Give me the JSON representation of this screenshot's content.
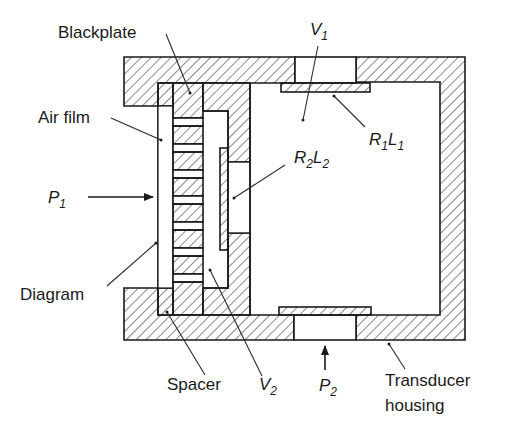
{
  "diagram": {
    "type": "cross-section",
    "labels": {
      "blackplate": "Blackplate",
      "air_film": "Air film",
      "p1": {
        "main": "P",
        "sub": "1"
      },
      "diagram": "Diagram",
      "spacer": "Spacer",
      "v1": {
        "main": "V",
        "sub": "1"
      },
      "v2": {
        "main": "V",
        "sub": "2"
      },
      "p2": {
        "main": "P",
        "sub": "2"
      },
      "r1l1": {
        "r": "R",
        "r_sub": "1",
        "l": "L",
        "l_sub": "1"
      },
      "r2l2": {
        "r": "R",
        "r_sub": "2",
        "l": "L",
        "l_sub": "2"
      },
      "transducer_line1": "Transducer",
      "transducer_line2": "housing"
    },
    "colors": {
      "stroke": "#1a1a1a",
      "background": "#ffffff"
    }
  }
}
